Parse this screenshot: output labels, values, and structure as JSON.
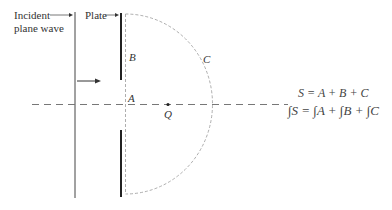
{
  "labels": {
    "incident_line1": "Incident",
    "incident_line2": "plane wave",
    "plate": "Plate",
    "B": "B",
    "A": "A",
    "C": "C",
    "Q": "Q"
  },
  "equations": {
    "surface_sum": "S = A + B + C",
    "integral_sum": "∫S = ∫A + ∫B + ∫C"
  },
  "colors": {
    "lines": "#333333",
    "dashed": "#999999"
  }
}
